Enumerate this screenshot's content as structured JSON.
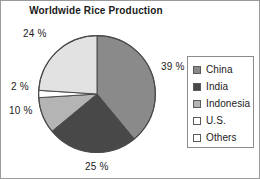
{
  "chart_data": {
    "type": "pie",
    "title": "Worldwide Rice Production",
    "xlabel": "",
    "ylabel": "",
    "legend_position": "right",
    "grid": false,
    "start_angle_deg": 0,
    "direction": "clockwise",
    "categories": [
      "China",
      "India",
      "Indonesia",
      "U.S.",
      "Others"
    ],
    "values": [
      39,
      25,
      10,
      2,
      24
    ],
    "value_unit": "%",
    "data_labels": [
      "39 %",
      "25 %",
      "10 %",
      "2 %",
      "24 %"
    ],
    "colors": [
      "#8a8a8a",
      "#484848",
      "#b4b4b4",
      "#ffffff",
      "#e2e2e2"
    ],
    "slices": [
      {
        "name": "China",
        "value": 39,
        "label": "39 %",
        "color": "#8a8a8a"
      },
      {
        "name": "India",
        "value": 25,
        "label": "25 %",
        "color": "#484848"
      },
      {
        "name": "Indonesia",
        "value": 10,
        "label": "10 %",
        "color": "#b4b4b4"
      },
      {
        "name": "U.S.",
        "value": 2,
        "label": "2 %",
        "color": "#ffffff"
      },
      {
        "name": "Others",
        "value": 24,
        "label": "24 %",
        "color": "#e2e2e2"
      }
    ]
  },
  "title": "Worldwide Rice Production",
  "labels": {
    "china": "39 %",
    "india": "25 %",
    "indonesia": "10 %",
    "us": "2 %",
    "others": "24 %"
  },
  "legend": {
    "items": [
      {
        "label": "China",
        "color": "#8a8a8a"
      },
      {
        "label": "India",
        "color": "#484848"
      },
      {
        "label": "Indonesia",
        "color": "#b4b4b4"
      },
      {
        "label": "U.S.",
        "color": "#ffffff"
      },
      {
        "label": "Others",
        "color": "#ffffff"
      }
    ]
  }
}
